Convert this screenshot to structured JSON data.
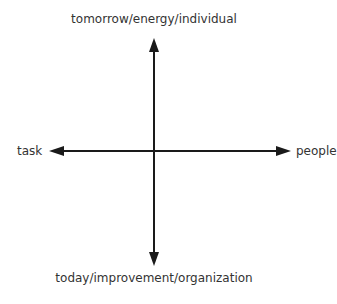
{
  "diagram": {
    "type": "quadrant-axes",
    "axes": {
      "vertical": {
        "top_label": "tomorrow/energy/individual",
        "bottom_label": "today/improvement/organization"
      },
      "horizontal": {
        "left_label": "task",
        "right_label": "people"
      }
    },
    "colors": {
      "line": "#1a1a1a",
      "text": "#333333",
      "background": "#ffffff"
    }
  }
}
